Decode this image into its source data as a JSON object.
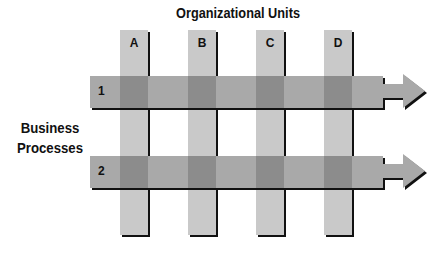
{
  "title": "Organizational Units",
  "side_label": [
    "Business",
    "Processes"
  ],
  "columns": [
    {
      "label": "A",
      "x": 120
    },
    {
      "label": "B",
      "x": 188
    },
    {
      "label": "C",
      "x": 256
    },
    {
      "label": "D",
      "x": 324
    }
  ],
  "bands": [
    {
      "label": "1",
      "y": 76
    },
    {
      "label": "2",
      "y": 156
    }
  ],
  "colors": {
    "column": "#c9c9c9",
    "band": "#a9a9a9",
    "intersection": "#8c8c8c",
    "shadow": "#111111"
  }
}
